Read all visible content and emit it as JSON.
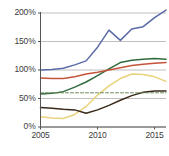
{
  "chart_data": {
    "type": "line",
    "title": "",
    "subtitle": "",
    "xlabel": "",
    "ylabel": "",
    "x": [
      2005,
      2006,
      2007,
      2008,
      2009,
      2010,
      2011,
      2012,
      2013,
      2014,
      2015,
      2016
    ],
    "xlim": [
      2005,
      2016
    ],
    "ylim": [
      0,
      200
    ],
    "xticks": [
      2005,
      2010,
      2015
    ],
    "xticklabels": [
      "2005",
      "2010",
      "2015"
    ],
    "yticks": [
      0,
      50,
      100,
      150,
      200
    ],
    "yticklabels": [
      "0%",
      "50%",
      "100%",
      "150%",
      "200%"
    ],
    "grid": "horizontal",
    "legend": "none",
    "series": [
      {
        "name": "blue-series",
        "color": "#5b6aa8",
        "style": "solid",
        "values": [
          100,
          101,
          103,
          109,
          116,
          140,
          170,
          152,
          172,
          176,
          192,
          205
        ]
      },
      {
        "name": "green-series",
        "color": "#2f6b3c",
        "style": "solid",
        "values": [
          58,
          59,
          62,
          70,
          79,
          90,
          102,
          113,
          117,
          119,
          120,
          119
        ]
      },
      {
        "name": "red-series",
        "color": "#c4543a",
        "style": "solid",
        "values": [
          86,
          85,
          85,
          88,
          93,
          96,
          100,
          104,
          108,
          110,
          112,
          113
        ]
      },
      {
        "name": "yellow-series",
        "color": "#e8d27a",
        "style": "solid",
        "values": [
          18,
          16,
          15,
          22,
          36,
          56,
          72,
          85,
          93,
          92,
          88,
          80
        ]
      },
      {
        "name": "dark-series",
        "color": "#3a2a1c",
        "style": "solid",
        "values": [
          34,
          33,
          31,
          30,
          24,
          30,
          38,
          47,
          55,
          61,
          63,
          63
        ]
      },
      {
        "name": "reference-line",
        "color": "#6d8a5e",
        "style": "dashed",
        "values": [
          60,
          60,
          60,
          60,
          60,
          60,
          60,
          60,
          60,
          60,
          60,
          60
        ]
      }
    ]
  },
  "axis_colors": {
    "grid": "#b8b8b8",
    "axis": "#555555",
    "tick_text": "#3b3b3b"
  }
}
